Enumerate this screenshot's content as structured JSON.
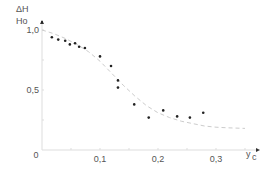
{
  "chart_data": {
    "type": "scatter",
    "title": "",
    "ylabel_top": "ΔH",
    "ylabel_bottom": "Ho",
    "xlabel_main": "y",
    "xlabel_sub": "c",
    "xlim": [
      0,
      0.35
    ],
    "ylim": [
      0,
      1.0
    ],
    "x_ticks": [
      {
        "v": 0.1,
        "label": "0,1"
      },
      {
        "v": 0.2,
        "label": "0,2"
      },
      {
        "v": 0.3,
        "label": "0,3"
      }
    ],
    "y_ticks": [
      {
        "v": 0.5,
        "label": "0,5"
      },
      {
        "v": 1.0,
        "label": "1,0"
      }
    ],
    "origin_label": "0",
    "grid": false,
    "series": [
      {
        "name": "measured",
        "kind": "points",
        "x": [
          0.017,
          0.028,
          0.04,
          0.048,
          0.057,
          0.064,
          0.074,
          0.1,
          0.119,
          0.131,
          0.131,
          0.159,
          0.184,
          0.209,
          0.233,
          0.255,
          0.278
        ],
        "y": [
          0.94,
          0.92,
          0.91,
          0.88,
          0.89,
          0.86,
          0.85,
          0.78,
          0.7,
          0.58,
          0.52,
          0.38,
          0.27,
          0.33,
          0.28,
          0.27,
          0.31
        ]
      },
      {
        "name": "fit",
        "kind": "dashed-line",
        "x": [
          0,
          0.02,
          0.04,
          0.06,
          0.08,
          0.1,
          0.12,
          0.14,
          0.16,
          0.18,
          0.2,
          0.22,
          0.24,
          0.26,
          0.28,
          0.3,
          0.32,
          0.35
        ],
        "y": [
          1.0,
          0.97,
          0.93,
          0.88,
          0.82,
          0.74,
          0.64,
          0.54,
          0.45,
          0.37,
          0.31,
          0.27,
          0.24,
          0.22,
          0.2,
          0.19,
          0.185,
          0.18
        ]
      }
    ],
    "colors": {
      "axis": "#dddddd",
      "points": "#222222",
      "fit": "#cccccc",
      "text": "#555555"
    }
  }
}
